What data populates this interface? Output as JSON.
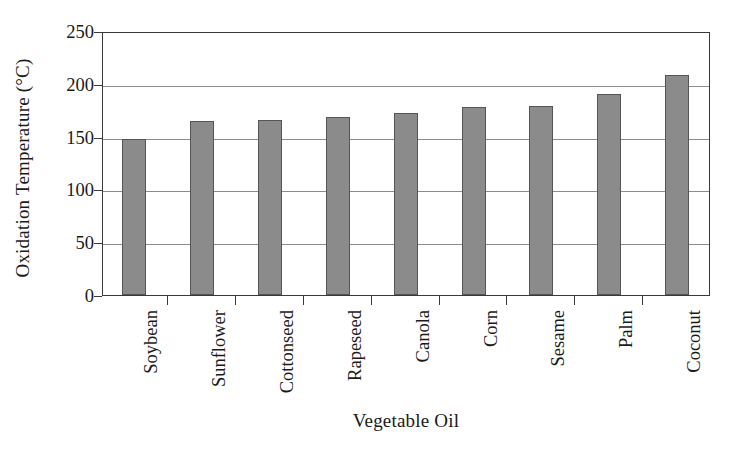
{
  "chart_data": {
    "type": "bar",
    "title": "",
    "xlabel": "Vegetable Oil",
    "ylabel": "Oxidation Temperature (°C)",
    "categories": [
      "Soybean",
      "Sunflower",
      "Cottonseed",
      "Rapeseed",
      "Canola",
      "Corn",
      "Sesame",
      "Palm",
      "Coconut"
    ],
    "values": [
      148,
      165,
      166,
      169,
      172,
      178,
      179,
      190,
      208
    ],
    "ylim": [
      0,
      250
    ],
    "yticks": [
      0,
      50,
      100,
      150,
      200,
      250
    ],
    "ytick_labels": [
      "0",
      "50",
      "100",
      "150",
      "200",
      "250"
    ],
    "grid": "horizontal",
    "legend": "none",
    "bar_color": "#8b8b8b",
    "bar_edge_color": "#555555",
    "axis_color": "#3a3a3a",
    "grid_color": "#8d8d8d",
    "background_color": "#ffffff"
  }
}
